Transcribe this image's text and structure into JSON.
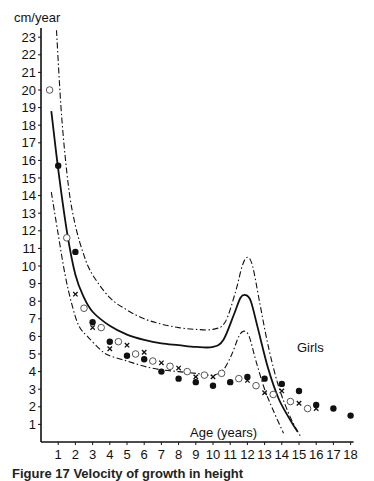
{
  "chart_data": {
    "type": "line",
    "title": "",
    "xlabel": "Age (years)",
    "ylabel": "cm/year",
    "series_label": "Girls",
    "xlim": [
      0,
      18
    ],
    "ylim": [
      0,
      23.5
    ],
    "grid": false,
    "x_ticks": [
      1,
      2,
      3,
      4,
      5,
      6,
      7,
      8,
      9,
      10,
      11,
      12,
      13,
      14,
      15,
      16,
      17,
      18
    ],
    "y_ticks": [
      1,
      2,
      3,
      4,
      5,
      6,
      7,
      8,
      9,
      10,
      11,
      12,
      13,
      14,
      15,
      16,
      17,
      18,
      19,
      20,
      21,
      22,
      23
    ],
    "curves": [
      {
        "name": "upper limit",
        "style": "dash-dot",
        "points": [
          [
            0.9,
            23.4
          ],
          [
            1.2,
            18.5
          ],
          [
            1.6,
            14.5
          ],
          [
            2,
            12.3
          ],
          [
            2.5,
            10.6
          ],
          [
            3,
            9.5
          ],
          [
            4,
            8.2
          ],
          [
            5,
            7.5
          ],
          [
            6,
            7.0
          ],
          [
            7,
            6.7
          ],
          [
            8,
            6.5
          ],
          [
            9,
            6.4
          ],
          [
            10,
            6.4
          ],
          [
            10.7,
            6.8
          ],
          [
            11.3,
            8.5
          ],
          [
            11.7,
            10.0
          ],
          [
            12,
            10.5
          ],
          [
            12.3,
            10.0
          ],
          [
            12.7,
            8.0
          ],
          [
            13.2,
            5.5
          ],
          [
            13.8,
            3.2
          ],
          [
            14.5,
            1.4
          ],
          [
            15.1,
            0.3
          ]
        ]
      },
      {
        "name": "mean",
        "style": "solid",
        "points": [
          [
            0.6,
            18.8
          ],
          [
            1,
            15.5
          ],
          [
            1.5,
            12.0
          ],
          [
            2,
            9.5
          ],
          [
            2.5,
            8.2
          ],
          [
            3,
            7.4
          ],
          [
            4,
            6.6
          ],
          [
            5,
            6.1
          ],
          [
            6,
            5.8
          ],
          [
            7,
            5.6
          ],
          [
            8,
            5.5
          ],
          [
            9,
            5.4
          ],
          [
            10,
            5.4
          ],
          [
            10.6,
            5.8
          ],
          [
            11.2,
            7.2
          ],
          [
            11.6,
            8.2
          ],
          [
            11.9,
            8.35
          ],
          [
            12.2,
            8.0
          ],
          [
            12.6,
            6.5
          ],
          [
            13.2,
            4.2
          ],
          [
            13.8,
            2.5
          ],
          [
            14.4,
            1.4
          ],
          [
            14.9,
            0.6
          ]
        ]
      },
      {
        "name": "lower limit",
        "style": "dash-dot",
        "points": [
          [
            0.6,
            14.2
          ],
          [
            1,
            11.8
          ],
          [
            1.4,
            9.5
          ],
          [
            1.8,
            7.8
          ],
          [
            2.2,
            6.6
          ],
          [
            2.7,
            6.0
          ],
          [
            3.5,
            5.2
          ],
          [
            4,
            4.9
          ],
          [
            5,
            4.6
          ],
          [
            6,
            4.3
          ],
          [
            7,
            4.1
          ],
          [
            8,
            4.0
          ],
          [
            9,
            3.9
          ],
          [
            10,
            3.8
          ],
          [
            10.6,
            4.1
          ],
          [
            11.1,
            5.0
          ],
          [
            11.5,
            6.0
          ],
          [
            11.8,
            6.3
          ],
          [
            12.1,
            6.0
          ],
          [
            12.5,
            4.6
          ],
          [
            13,
            3.0
          ],
          [
            13.5,
            1.8
          ],
          [
            14.1,
            0.5
          ]
        ]
      }
    ],
    "series": [
      {
        "name": "open circles",
        "marker": "open-circle",
        "points": [
          [
            0.5,
            20.0
          ],
          [
            1.5,
            11.6
          ],
          [
            2.5,
            7.6
          ],
          [
            3.5,
            6.5
          ],
          [
            4.5,
            5.7
          ],
          [
            5.5,
            5.0
          ],
          [
            6.5,
            4.6
          ],
          [
            7.5,
            4.3
          ],
          [
            8.5,
            4.0
          ],
          [
            9.5,
            3.8
          ],
          [
            10.5,
            3.9
          ],
          [
            11.5,
            3.6
          ],
          [
            12.5,
            3.2
          ],
          [
            13.5,
            2.7
          ],
          [
            14.5,
            2.3
          ],
          [
            15.5,
            1.9
          ]
        ]
      },
      {
        "name": "filled circles",
        "marker": "filled-circle",
        "points": [
          [
            1,
            15.7
          ],
          [
            2,
            10.8
          ],
          [
            3,
            6.8
          ],
          [
            4,
            5.7
          ],
          [
            5,
            4.9
          ],
          [
            6,
            4.7
          ],
          [
            7,
            4.0
          ],
          [
            8,
            3.6
          ],
          [
            9,
            3.4
          ],
          [
            10,
            3.2
          ],
          [
            11,
            3.4
          ],
          [
            12,
            3.7
          ],
          [
            13,
            3.6
          ],
          [
            14,
            3.3
          ],
          [
            15,
            2.9
          ],
          [
            16,
            2.1
          ],
          [
            17,
            1.9
          ],
          [
            18,
            1.5
          ]
        ]
      },
      {
        "name": "crosses",
        "marker": "cross",
        "points": [
          [
            2,
            8.4
          ],
          [
            3,
            6.5
          ],
          [
            4,
            5.3
          ],
          [
            5,
            5.5
          ],
          [
            6,
            5.1
          ],
          [
            7,
            4.5
          ],
          [
            8,
            4.2
          ],
          [
            9,
            3.7
          ],
          [
            10,
            3.7
          ],
          [
            11,
            3.4
          ],
          [
            12,
            3.5
          ],
          [
            13,
            2.8
          ],
          [
            14,
            2.9
          ],
          [
            15,
            2.2
          ],
          [
            16,
            1.9
          ]
        ]
      }
    ]
  },
  "labels": {
    "y_unit": "cm/year",
    "x_title": "Age (years)",
    "curve_label": "Girls",
    "caption": "Figure 17   Velocity of growth in height"
  }
}
